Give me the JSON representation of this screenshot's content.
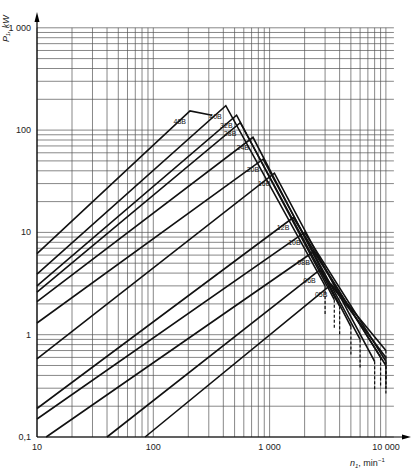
{
  "chart_data": {
    "type": "line",
    "title": "",
    "xlabel": "n1, min⁻¹",
    "ylabel": "P1, kW",
    "xscale": "log",
    "yscale": "log",
    "xlim": [
      10,
      10000
    ],
    "ylim": [
      0.1,
      1000
    ],
    "x_ticks": [
      "10",
      "100",
      "1 000",
      "10 000"
    ],
    "y_ticks": [
      "0,1",
      "1",
      "10",
      "100",
      "1 000"
    ],
    "grid": true,
    "legend": "inline labels on curves",
    "series": [
      {
        "name": "48B",
        "points": [
          [
            10,
            6.2
          ],
          [
            207,
            154
          ],
          [
            320,
            140
          ]
        ],
        "peak": [
          207,
          154
        ]
      },
      {
        "name": "40B",
        "points": [
          [
            10,
            3.9
          ],
          [
            420,
            173
          ],
          [
            3000,
            3.0
          ]
        ],
        "peak": [
          420,
          173
        ]
      },
      {
        "name": "32B",
        "points": [
          [
            10,
            3.0
          ],
          [
            520,
            140
          ],
          [
            3600,
            2.2
          ]
        ],
        "peak": [
          520,
          140
        ]
      },
      {
        "name": "28B",
        "points": [
          [
            10,
            2.6
          ],
          [
            560,
            118
          ],
          [
            4000,
            1.9
          ]
        ],
        "peak": [
          560,
          118
        ]
      },
      {
        "name": "24B",
        "points": [
          [
            10,
            2.1
          ],
          [
            720,
            85
          ],
          [
            5000,
            1.2
          ]
        ],
        "peak": [
          720,
          85
        ]
      },
      {
        "name": "20B",
        "points": [
          [
            10,
            1.3
          ],
          [
            880,
            52
          ],
          [
            6000,
            0.9
          ]
        ],
        "peak": [
          880,
          52
        ]
      },
      {
        "name": "16B",
        "points": [
          [
            10,
            0.58
          ],
          [
            1100,
            38
          ],
          [
            8000,
            0.55
          ]
        ],
        "peak": [
          1100,
          38
        ]
      },
      {
        "name": "12B",
        "points": [
          [
            10,
            0.19
          ],
          [
            1600,
            14
          ],
          [
            9000,
            0.6
          ]
        ],
        "peak": [
          1600,
          14
        ]
      },
      {
        "name": "10B",
        "points": [
          [
            10,
            0.15
          ],
          [
            2000,
            10
          ],
          [
            10000,
            0.55
          ]
        ],
        "peak": [
          2000,
          10
        ]
      },
      {
        "name": "08B",
        "points": [
          [
            12,
            0.1
          ],
          [
            2400,
            6.5
          ],
          [
            10000,
            0.5
          ]
        ],
        "peak": [
          2400,
          6.5
        ]
      },
      {
        "name": "06B",
        "points": [
          [
            40,
            0.1
          ],
          [
            2700,
            4.3
          ],
          [
            10000,
            0.6
          ]
        ],
        "peak": [
          2700,
          4.3
        ]
      },
      {
        "name": "05B",
        "points": [
          [
            85,
            0.1
          ],
          [
            3400,
            3.1
          ],
          [
            10000,
            0.7
          ]
        ],
        "peak": [
          3400,
          3.1
        ]
      }
    ]
  },
  "axes": {
    "x_label_main": "n",
    "x_label_sub": "1",
    "x_label_unit": ", min",
    "x_label_exp": "−1",
    "y_label": "P₁, kW"
  }
}
